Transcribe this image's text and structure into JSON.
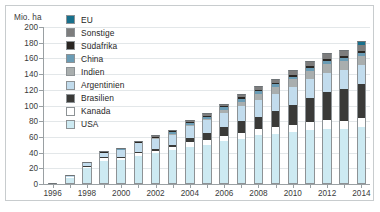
{
  "figure": {
    "unit_label": "Mio. ha",
    "frame_color": "#c8ccce"
  },
  "legend": {
    "position": "top-left-inside",
    "items": [
      {
        "label": "EU",
        "color": "#17708c"
      },
      {
        "label": "Sonstige",
        "color": "#7d7d7d"
      },
      {
        "label": "Südafrika",
        "color": "#2a2622"
      },
      {
        "label": "China",
        "color": "#6a9cb5"
      },
      {
        "label": "Indien",
        "color": "#a9aeae"
      },
      {
        "label": "Argentinien",
        "color": "#c2dced"
      },
      {
        "label": "Brasilien",
        "color": "#3a3a38"
      },
      {
        "label": "Kanada",
        "color": "#ffffff"
      },
      {
        "label": "USA",
        "color": "#cdeaf2"
      }
    ]
  },
  "chart_data": {
    "type": "bar",
    "title": "",
    "subtitle": "",
    "stacked": true,
    "xlabel": "",
    "ylabel": "Mio. ha",
    "ylim": [
      0,
      200
    ],
    "ytick_step": 20,
    "yticks": [
      0,
      20,
      40,
      60,
      80,
      100,
      120,
      140,
      160,
      180,
      200
    ],
    "ytick_labels": [
      "0",
      "20",
      "40",
      "60",
      "80",
      "100",
      "120",
      "140",
      "160",
      "180",
      "200"
    ],
    "grid": "horizontal",
    "legend_position": "top-left",
    "categories": [
      1996,
      1997,
      1998,
      1999,
      2000,
      2001,
      2002,
      2003,
      2004,
      2005,
      2006,
      2007,
      2008,
      2009,
      2010,
      2011,
      2012,
      2013,
      2014
    ],
    "xtick_labels": [
      "1996",
      "",
      "1998",
      "",
      "2000",
      "",
      "2002",
      "",
      "2004",
      "",
      "2006",
      "",
      "2008",
      "",
      "2010",
      "",
      "2012",
      "",
      "2014"
    ],
    "stack_order_bottom_to_top": [
      "USA",
      "Kanada",
      "Brasilien",
      "Argentinien",
      "Indien",
      "China",
      "Südafrika",
      "Sonstige",
      "EU"
    ],
    "series": [
      {
        "name": "USA",
        "color": "#cdeaf2",
        "values": [
          1.5,
          8.1,
          20.5,
          28.7,
          30.3,
          35.7,
          39.0,
          42.8,
          47.6,
          49.8,
          54.6,
          57.7,
          62.5,
          64.0,
          66.8,
          69.0,
          69.5,
          70.1,
          73.1
        ]
      },
      {
        "name": "Kanada",
        "color": "#ffffff",
        "values": [
          0.1,
          1.3,
          2.8,
          4.0,
          3.0,
          3.2,
          3.5,
          4.4,
          5.4,
          5.8,
          6.1,
          7.0,
          7.6,
          8.2,
          8.8,
          10.4,
          11.6,
          10.8,
          11.6
        ]
      },
      {
        "name": "Brasilien",
        "color": "#3a3a38",
        "values": [
          0.0,
          0.0,
          0.1,
          1.2,
          1.3,
          1.5,
          2.0,
          3.0,
          5.0,
          9.4,
          11.5,
          15.0,
          15.8,
          21.4,
          25.4,
          30.3,
          36.6,
          40.3,
          42.2
        ]
      },
      {
        "name": "Argentinien",
        "color": "#c2dced",
        "values": [
          0.1,
          1.4,
          4.3,
          6.7,
          10.0,
          11.8,
          13.5,
          13.9,
          16.2,
          17.1,
          18.0,
          19.1,
          21.0,
          21.3,
          22.9,
          23.7,
          23.9,
          24.4,
          24.3
        ]
      },
      {
        "name": "Indien",
        "color": "#a9aeae",
        "values": [
          0.0,
          0.0,
          0.0,
          0.0,
          0.0,
          0.0,
          0.1,
          0.1,
          0.5,
          1.3,
          3.8,
          6.2,
          7.6,
          8.4,
          9.4,
          10.6,
          10.8,
          11.0,
          11.6
        ]
      },
      {
        "name": "China",
        "color": "#6a9cb5",
        "values": [
          0.0,
          0.0,
          0.1,
          0.3,
          0.5,
          1.5,
          2.1,
          2.8,
          3.7,
          3.3,
          3.5,
          3.8,
          3.8,
          3.7,
          3.5,
          3.9,
          4.0,
          4.2,
          3.9
        ]
      },
      {
        "name": "Südafrika",
        "color": "#2a2622",
        "values": [
          0.0,
          0.0,
          0.0,
          0.1,
          0.2,
          0.2,
          0.3,
          0.4,
          0.5,
          0.5,
          1.4,
          1.8,
          1.8,
          2.1,
          2.2,
          2.3,
          2.9,
          2.9,
          2.7
        ]
      },
      {
        "name": "Sonstige",
        "color": "#7d7d7d",
        "values": [
          0.0,
          0.2,
          0.4,
          0.8,
          1.0,
          1.2,
          1.5,
          1.8,
          2.4,
          2.6,
          3.1,
          3.8,
          4.6,
          5.0,
          5.8,
          6.3,
          6.9,
          7.4,
          8.1
        ]
      },
      {
        "name": "EU",
        "color": "#17708c",
        "values": [
          0.0,
          0.0,
          0.0,
          0.0,
          0.0,
          0.0,
          0.0,
          0.0,
          0.1,
          0.1,
          0.1,
          0.1,
          0.1,
          0.1,
          0.1,
          0.1,
          0.1,
          0.1,
          4.5
        ]
      }
    ],
    "totals": [
      1.7,
      11.0,
      28.2,
      41.8,
      46.3,
      55.1,
      62.0,
      69.2,
      81.4,
      89.9,
      102.1,
      114.5,
      124.8,
      134.2,
      144.9,
      156.6,
      166.3,
      171.2,
      182.0
    ]
  }
}
